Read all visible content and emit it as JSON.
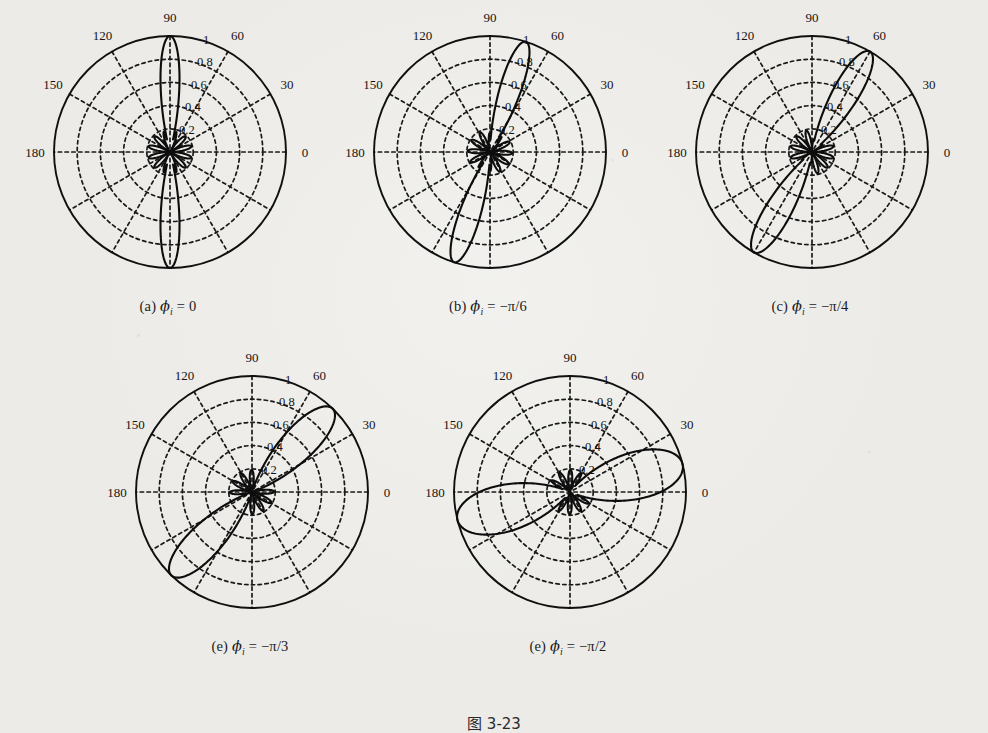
{
  "figure": {
    "number_label": "图 3-23",
    "background_color": "#ecebe7",
    "ink_color": "#101010"
  },
  "panels": [
    {
      "id": "a",
      "caption_prefix": "(a)",
      "caption_symbol": "ϕ",
      "caption_subscript": "i",
      "caption_value": "= 0",
      "caption_full": "(a) ϕi = 0"
    },
    {
      "id": "b",
      "caption_prefix": "(b)",
      "caption_symbol": "ϕ",
      "caption_subscript": "i",
      "caption_value": "= −π/6",
      "caption_full": "(b) ϕi = −π/6"
    },
    {
      "id": "c",
      "caption_prefix": "(c)",
      "caption_symbol": "ϕ",
      "caption_subscript": "i",
      "caption_value": "= −π/4",
      "caption_full": "(c) ϕi = −π/4"
    },
    {
      "id": "d",
      "caption_prefix": "(e)",
      "caption_symbol": "ϕ",
      "caption_subscript": "i",
      "caption_value": "= −π/3",
      "caption_full": "(e) ϕi = −π/3"
    },
    {
      "id": "e",
      "caption_prefix": "(e)",
      "caption_symbol": "ϕ",
      "caption_subscript": "i",
      "caption_value": "= −π/2",
      "caption_full": "(e) ϕi = −π/2"
    }
  ],
  "chart_data": {
    "type": "line",
    "subtype": "polar-radiation-pattern",
    "title": "图 3-23",
    "panel_count": 5,
    "angle_unit": "degrees",
    "angle_ticks": [
      0,
      30,
      60,
      90,
      120,
      150,
      180
    ],
    "angle_tick_labels": [
      "0",
      "30",
      "60",
      "90",
      "120",
      "150",
      "180"
    ],
    "angle_gridline_step": 30,
    "radial_ticks": [
      0.2,
      0.4,
      0.6,
      0.8,
      1
    ],
    "radial_tick_labels": [
      "0.2",
      "0.4",
      "0.6",
      "0.8",
      "1"
    ],
    "radial_label_angle": 75,
    "rlim": [
      0,
      1
    ],
    "grid": true,
    "grid_style": "dotted",
    "outer_ring_style": "solid",
    "legend": "none",
    "xlabel": "",
    "ylabel": "",
    "series": [
      {
        "name": "(a) ϕi = 0",
        "main_lobe_angle_deg": 90,
        "main_lobe_peak": 1.0,
        "sidelobe_peak": 0.2,
        "beamwidth_deg": 16,
        "mirror_lobe_angle_deg": 270,
        "sidelobe_count": 12
      },
      {
        "name": "(b) ϕi = −π/6",
        "main_lobe_angle_deg": 72,
        "main_lobe_peak": 1.0,
        "sidelobe_peak": 0.2,
        "beamwidth_deg": 18,
        "mirror_lobe_angle_deg": 252,
        "sidelobe_count": 12
      },
      {
        "name": "(c) ϕi = −π/4",
        "main_lobe_angle_deg": 60,
        "main_lobe_peak": 1.0,
        "sidelobe_peak": 0.2,
        "beamwidth_deg": 22,
        "mirror_lobe_angle_deg": 240,
        "sidelobe_count": 12
      },
      {
        "name": "(e) ϕi = −π/3",
        "main_lobe_angle_deg": 46,
        "main_lobe_peak": 1.0,
        "sidelobe_peak": 0.2,
        "beamwidth_deg": 28,
        "mirror_lobe_angle_deg": 226,
        "sidelobe_count": 12
      },
      {
        "name": "(e) ϕi = −π/2",
        "main_lobe_angle_deg": 14,
        "main_lobe_peak": 1.0,
        "sidelobe_peak": 0.2,
        "beamwidth_deg": 40,
        "mirror_lobe_angle_deg": 194,
        "sidelobe_count": 12
      }
    ]
  }
}
